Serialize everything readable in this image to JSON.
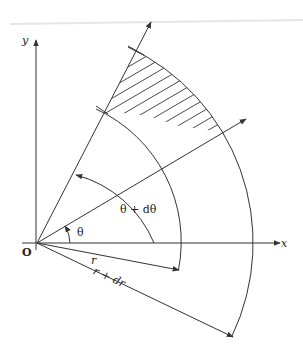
{
  "diagram": {
    "colors": {
      "line": "#333333",
      "background": "#ffffff"
    },
    "labels": {
      "y_axis": "y",
      "x_axis": "x",
      "origin": "O",
      "theta": "θ",
      "theta_plus_dtheta": "θ + dθ",
      "r": "r",
      "r_plus_dr": "r + dr"
    },
    "geometry": {
      "origin": [
        37,
        243
      ],
      "inner_radius": 146,
      "outer_radius": 216,
      "theta_deg": 30.8,
      "theta_plus_dtheta_deg": 62.7,
      "shaded_region": "annular sector between r and r+dr, θ to θ+dθ"
    }
  }
}
